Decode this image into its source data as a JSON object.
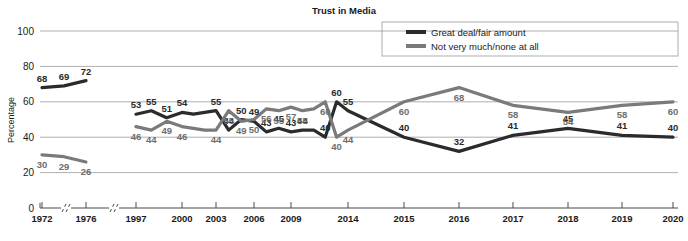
{
  "chart_data": {
    "type": "line",
    "title": "Trust in Media",
    "xlabel": "",
    "ylabel": "Percentage",
    "ylim": [
      0,
      100
    ],
    "yticks": [
      0,
      20,
      40,
      60,
      80,
      100
    ],
    "grid": true,
    "legend_position": "top-right",
    "axis_breaks": [
      "between 1972 and 1976",
      "between 1976 and 1997"
    ],
    "x": [
      "1972",
      "1976",
      "1997",
      "2000",
      "2003",
      "2006",
      "2009",
      "2014",
      "2015",
      "2016",
      "2017",
      "2018",
      "2019",
      "2020"
    ],
    "xticks": [
      "1972",
      "1976",
      "1997",
      "2000",
      "2003",
      "2006",
      "2009",
      "2014",
      "2015",
      "2016",
      "2017",
      "2018",
      "2019",
      "2020"
    ],
    "series": [
      {
        "name": "Great deal/fair amount",
        "color": "#2b2b2b",
        "x": [
          "1972",
          "1974",
          "1976",
          "1997",
          "1998",
          "1999",
          "2000",
          "2001",
          "2002",
          "2003",
          "2004",
          "2005",
          "2006",
          "2007",
          "2008",
          "2009",
          "2010",
          "2011",
          "2012",
          "2013",
          "2014",
          "2015",
          "2016",
          "2017",
          "2018",
          "2019",
          "2020"
        ],
        "values": [
          68,
          69,
          72,
          53,
          55,
          51,
          54,
          53,
          54,
          55,
          44,
          50,
          49,
          43,
          45,
          43,
          44,
          44,
          40,
          60,
          55,
          40,
          32,
          41,
          45,
          41,
          40
        ],
        "labels": [
          68,
          69,
          72,
          53,
          55,
          51,
          54,
          null,
          null,
          55,
          44,
          50,
          49,
          43,
          45,
          43,
          44,
          null,
          40,
          60,
          55,
          40,
          32,
          41,
          45,
          41,
          40
        ]
      },
      {
        "name": "Not very much/none at all",
        "color": "#7a7a7a",
        "x": [
          "1972",
          "1974",
          "1976",
          "1997",
          "1998",
          "1999",
          "2000",
          "2001",
          "2002",
          "2003",
          "2004",
          "2005",
          "2006",
          "2007",
          "2008",
          "2009",
          "2010",
          "2011",
          "2012",
          "2013",
          "2014",
          "2015",
          "2016",
          "2017",
          "2018",
          "2019",
          "2020"
        ],
        "values": [
          30,
          29,
          26,
          46,
          44,
          49,
          46,
          45,
          44,
          44,
          55,
          49,
          50,
          56,
          55,
          57,
          55,
          56,
          60,
          40,
          44,
          60,
          68,
          58,
          54,
          58,
          60
        ],
        "labels": [
          30,
          29,
          26,
          46,
          44,
          49,
          46,
          null,
          null,
          44,
          55,
          49,
          50,
          56,
          55,
          57,
          55,
          null,
          60,
          40,
          44,
          60,
          68,
          58,
          54,
          58,
          60
        ]
      }
    ],
    "legend": [
      {
        "label": "Great deal/fair amount",
        "color": "#2b2b2b"
      },
      {
        "label": "Not very much/none at all",
        "color": "#7a7a7a"
      }
    ]
  },
  "colors": {
    "series_dark": "#2b2b2b",
    "series_grey": "#7a7a7a",
    "grid": "#9a9a9a",
    "axis": "#4a4a4a",
    "text": "#1a1a1a",
    "background": "#ffffff"
  }
}
